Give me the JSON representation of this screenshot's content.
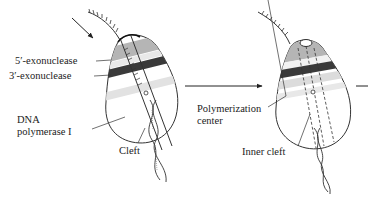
{
  "diagram": {
    "panels": [
      {
        "id": "left",
        "labels": {
          "five_exo": "5′-exonuclease",
          "three_exo": "3′-exonuclease",
          "dna_pol_line1": "DNA",
          "dna_pol_line2": "polymerase I",
          "cleft": "Cleft"
        }
      },
      {
        "id": "right",
        "labels": {
          "polymerization_line1": "Polymerization",
          "polymerization_line2": "center",
          "inner_cleft": "Inner cleft"
        }
      }
    ],
    "colors": {
      "outline": "#333333",
      "band_light": "#cfcfcf",
      "band_mid": "#9a9a9a",
      "band_dark": "#3a3a3a",
      "body_fill": "#ffffff",
      "pale_band": "#e6e6e6"
    }
  }
}
